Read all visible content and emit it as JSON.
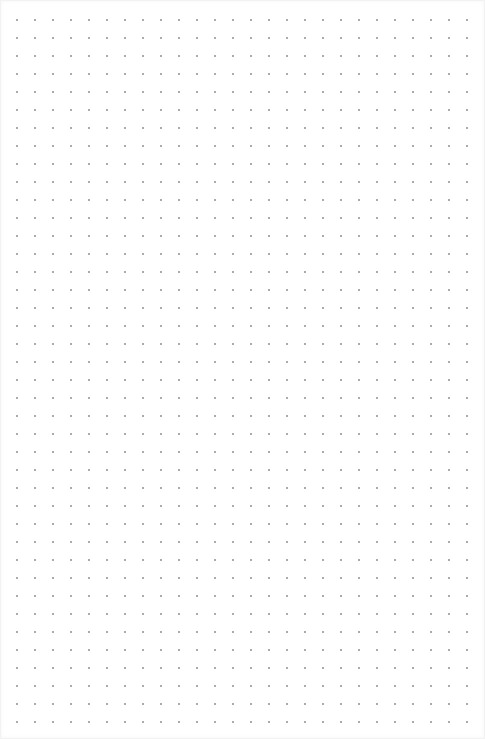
{
  "page": {
    "type": "dot-grid-notebook-page",
    "background_color": "#ffffff",
    "dot_color": "#9a9a9a",
    "dot_spacing_px": 18
  }
}
